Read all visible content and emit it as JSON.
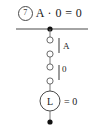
{
  "figure": {
    "marker": "7",
    "title": "A · 0 = 0",
    "width": 100,
    "height": 127,
    "ink_color": "#1a1a1a",
    "line_color": "#4a4a4a"
  },
  "circuit": {
    "rail": {
      "label": "supply-rail",
      "junction_label": "junction-dot"
    },
    "switches": [
      {
        "id": "switch-a",
        "label": "A",
        "terminals": 2,
        "state": "open"
      },
      {
        "id": "switch-zero",
        "label": "0",
        "terminals": 2,
        "state": "open"
      }
    ],
    "lamp": {
      "symbol": "L",
      "value_label": "= 0"
    },
    "ground": {
      "label": "terminal-dot"
    }
  }
}
